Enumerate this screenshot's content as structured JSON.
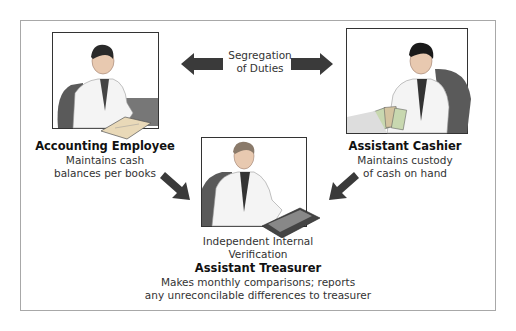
{
  "diagram": {
    "center_label": {
      "line1": "Segregation",
      "line2": "of Duties"
    },
    "roles": [
      {
        "title": "Accounting Employee",
        "desc_line1": "Maintains cash",
        "desc_line2": "balances per books",
        "illustration": "man-reading-ledger"
      },
      {
        "title": "Assistant Cashier",
        "desc_line1": "Maintains custody",
        "desc_line2": "of cash on hand",
        "illustration": "man-counting-money"
      },
      {
        "title": "Assistant Treasurer",
        "caption_line1": "Independent Internal",
        "caption_line2": "Verification",
        "desc_line1": "Makes monthly comparisons; reports",
        "desc_line2": "any unreconcilable differences to treasurer",
        "illustration": "man-using-calculator"
      }
    ],
    "colors": {
      "arrow": "#3a3a3a",
      "frame": "#a8a8a8",
      "chair": "#555555"
    }
  }
}
